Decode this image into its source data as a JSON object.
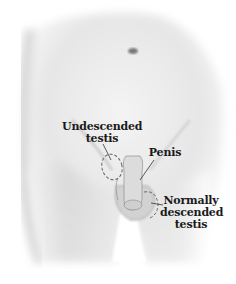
{
  "figure": {
    "colors": {
      "background": "#ffffff",
      "skin_light": "#f0f0f0",
      "skin_shade": "#c8c8c8",
      "outline": "#555555",
      "text": "#1a1a1a"
    }
  },
  "labels": {
    "undescended": {
      "line1": "Undescended",
      "line2": "testis"
    },
    "penis": {
      "line1": "Penis"
    },
    "normal": {
      "line1": "Normally",
      "line2": "descended",
      "line3": "testis"
    }
  }
}
